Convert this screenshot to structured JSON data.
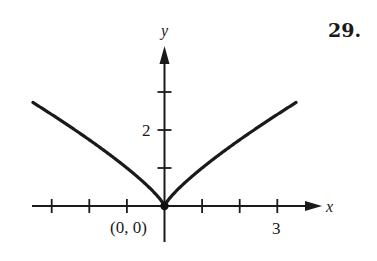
{
  "problem_number": "29.",
  "chart_data": {
    "type": "line",
    "title": "",
    "function": "y = |x|^(4/5)",
    "xlabel": "x",
    "ylabel": "y",
    "xlim": [
      -3.5,
      3.5
    ],
    "ylim": [
      0,
      3.2
    ],
    "x_ticks": [
      -3,
      -2,
      -1,
      0,
      1,
      2,
      3
    ],
    "y_ticks": [
      1,
      2,
      3
    ],
    "x_tick_labels": [
      {
        "value": 3,
        "label": "3"
      }
    ],
    "y_tick_labels": [
      {
        "value": 2,
        "label": "2"
      }
    ],
    "annotations": [
      {
        "text": "(0, 0)",
        "x": 0,
        "y": 0,
        "marker": "filled-dot"
      }
    ],
    "series": [
      {
        "name": "curve",
        "x": [
          -3.5,
          -3,
          -2.5,
          -2,
          -1.5,
          -1,
          -0.5,
          -0.25,
          0,
          0.25,
          0.5,
          1,
          1.5,
          2,
          2.5,
          3,
          3.5
        ],
        "y": [
          2.73,
          2.41,
          2.08,
          1.74,
          1.38,
          1.0,
          0.57,
          0.33,
          0,
          0.33,
          0.57,
          1.0,
          1.38,
          1.74,
          2.08,
          2.41,
          2.73
        ]
      }
    ],
    "grid": false,
    "legend": "none"
  },
  "labels": {
    "x_axis": "x",
    "y_axis": "y",
    "origin": "(0, 0)",
    "x_tick_3": "3",
    "y_tick_2": "2"
  }
}
